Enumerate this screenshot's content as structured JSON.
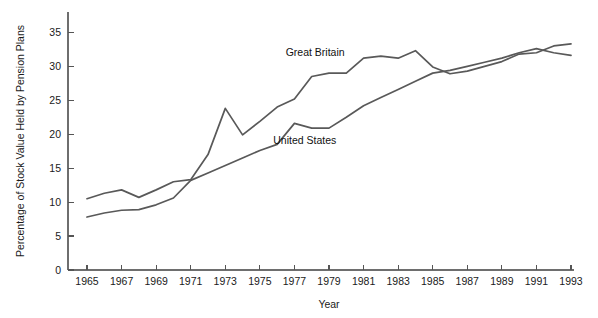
{
  "chart_data": {
    "type": "line",
    "title": "",
    "xlabel": "Year",
    "ylabel": "Percentage of Stock Value Held by Pension Plans",
    "xlim": [
      1965,
      1993
    ],
    "ylim": [
      0,
      38
    ],
    "xticks": [
      1965,
      1967,
      1969,
      1971,
      1973,
      1975,
      1977,
      1979,
      1981,
      1983,
      1985,
      1987,
      1989,
      1991,
      1993
    ],
    "yticks": [
      0,
      5,
      10,
      15,
      20,
      25,
      30,
      35
    ],
    "grid": false,
    "legend_position": "inline-labels",
    "x": [
      1965,
      1966,
      1967,
      1968,
      1969,
      1970,
      1971,
      1972,
      1973,
      1974,
      1975,
      1976,
      1977,
      1978,
      1979,
      1980,
      1981,
      1982,
      1983,
      1984,
      1985,
      1986,
      1987,
      1988,
      1989,
      1990,
      1991,
      1992,
      1993
    ],
    "series": [
      {
        "name": "Great Britain",
        "color": "#595959",
        "label_x": 1978.2,
        "label_y": 31.5,
        "values": [
          10.5,
          11.3,
          11.8,
          10.7,
          11.8,
          13.0,
          13.3,
          17.0,
          23.8,
          19.9,
          21.9,
          24.0,
          25.2,
          28.5,
          29.0,
          29.0,
          31.2,
          31.5,
          31.2,
          32.3,
          29.9,
          28.9,
          29.3,
          30.0,
          30.7,
          31.8,
          32.0,
          33.0,
          33.3
        ]
      },
      {
        "name": "United States",
        "color": "#595959",
        "label_x": 1977.6,
        "label_y": 18.6,
        "values": [
          7.8,
          8.4,
          8.8,
          8.9,
          9.6,
          10.6,
          13.2,
          14.3,
          15.4,
          16.5,
          17.6,
          18.5,
          21.6,
          20.9,
          20.9,
          22.5,
          24.2,
          25.4,
          26.6,
          27.8,
          29.0,
          29.4,
          30.0,
          30.6,
          31.2,
          32.0,
          32.6,
          32.0,
          31.6
        ]
      }
    ]
  }
}
